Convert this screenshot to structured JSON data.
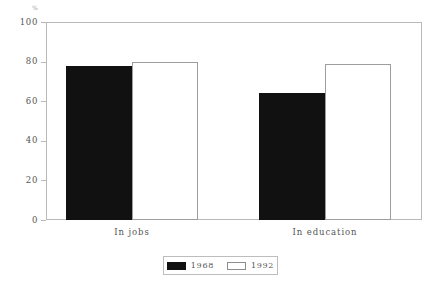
{
  "chart_data": {
    "type": "bar",
    "title": "",
    "subtitle": "",
    "xlabel": "",
    "ylabel": "%",
    "categories": [
      "In jobs",
      "In education"
    ],
    "series": [
      {
        "name": "1968",
        "values": [
          78,
          64
        ],
        "color": "#111111"
      },
      {
        "name": "1992",
        "values": [
          80,
          79
        ],
        "color": "#ffffff"
      }
    ],
    "ylim": [
      0,
      100
    ],
    "yticks": [
      0,
      20,
      40,
      60,
      80,
      100
    ],
    "ytick_labels": [
      "0",
      "20",
      "40",
      "60",
      "80",
      "100"
    ],
    "grid": false,
    "legend_position": "bottom-center",
    "frame": true,
    "bar_gap_within_group": 0,
    "orientation": "vertical"
  },
  "axes": {
    "y_unit_label": "%",
    "y_tick_0": "0",
    "y_tick_1": "20",
    "y_tick_2": "40",
    "y_tick_3": "60",
    "y_tick_4": "80",
    "y_tick_5": "100"
  },
  "categories": {
    "cat_0": "In jobs",
    "cat_1": "In education"
  },
  "legend": {
    "entry_0_label": "1968",
    "entry_1_label": "1992"
  }
}
